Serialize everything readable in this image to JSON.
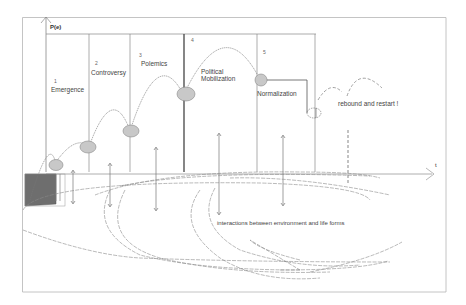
{
  "diagram": {
    "y_axis_label": "P(e)",
    "x_axis_label": "t",
    "phases": [
      {
        "number": "1",
        "label": "Emergence"
      },
      {
        "number": "2",
        "label": "Controversy"
      },
      {
        "number": "3",
        "label": "Polemics"
      },
      {
        "number": "4",
        "label": "Political Mobilization"
      },
      {
        "number": "5",
        "label": "Normalization"
      }
    ],
    "phase_4_line1": "Political",
    "phase_4_line2": "Mobilization",
    "rebound_label": "rebound and restart !",
    "bottom_label": "interactions between environment and life forms",
    "colors": {
      "line": "#777777",
      "node_fill": "#c8c8c8",
      "box_fill": "#6e6e6e",
      "frame": "#aaaaaa"
    }
  }
}
